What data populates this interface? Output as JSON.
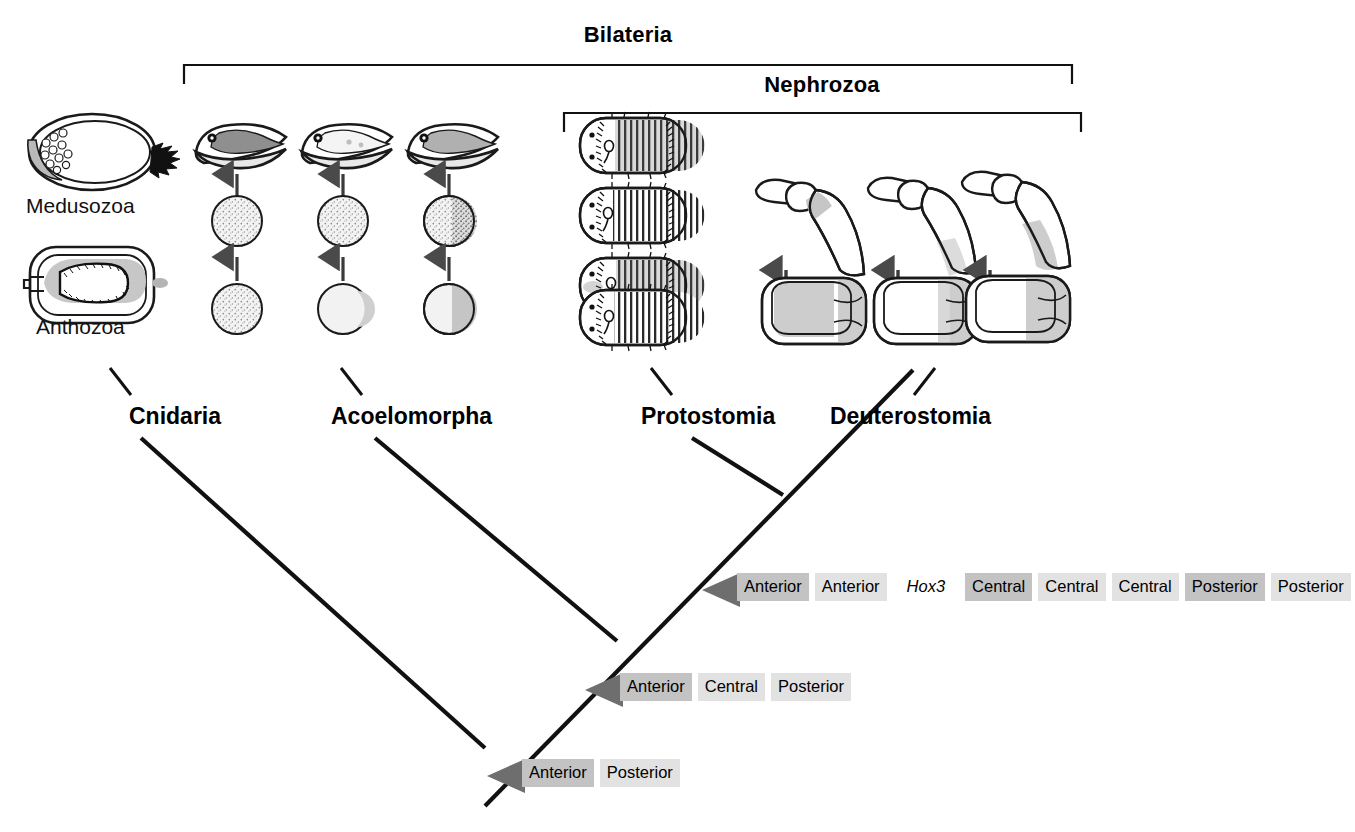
{
  "figure": {
    "type": "cladogram-with-illustrations",
    "background": "#ffffff"
  },
  "brackets": [
    {
      "name": "bilateria",
      "label": "Bilateria",
      "x1": 184,
      "x2": 1072,
      "y": 65,
      "label_x": 628,
      "label_y": 22
    },
    {
      "name": "nephrozoa",
      "label": "Nephrozoa",
      "x1": 564,
      "x2": 1081,
      "y": 113,
      "label_x": 822,
      "label_y": 72
    }
  ],
  "taxa": [
    {
      "name": "cnidaria",
      "label": "Cnidaria",
      "x": 129,
      "y": 403
    },
    {
      "name": "acoelomorpha",
      "label": "Acoelomorpha",
      "x": 331,
      "y": 403
    },
    {
      "name": "protostomia",
      "label": "Protostomia",
      "x": 641,
      "y": 403
    },
    {
      "name": "deuterostomia",
      "label": "Deuterostomia",
      "x": 830,
      "y": 403
    }
  ],
  "illustration_captions": [
    {
      "name": "medusozoa",
      "label": "Medusozoa",
      "x": 26,
      "y": 194
    },
    {
      "name": "anthozoa",
      "label": "Anthozoa",
      "x": 36,
      "y": 315
    }
  ],
  "hox_rows": [
    {
      "name": "nephrozoa-hox-cluster",
      "arrow_x": 700,
      "arrow_y": 575,
      "boxes_x": 737,
      "boxes_y": 573,
      "genes": [
        {
          "label": "Anterior",
          "shade": "dark"
        },
        {
          "label": "Anterior",
          "shade": "light"
        },
        {
          "label": "Hox3",
          "shade": "plain"
        },
        {
          "label": "Central",
          "shade": "dark"
        },
        {
          "label": "Central",
          "shade": "light"
        },
        {
          "label": "Central",
          "shade": "light"
        },
        {
          "label": "Posterior",
          "shade": "dark"
        },
        {
          "label": "Posterior",
          "shade": "light"
        }
      ]
    },
    {
      "name": "bilateria-hox-cluster",
      "arrow_x": 583,
      "arrow_y": 675,
      "boxes_x": 620,
      "boxes_y": 673,
      "genes": [
        {
          "label": "Anterior",
          "shade": "dark"
        },
        {
          "label": "Central",
          "shade": "light"
        },
        {
          "label": "Posterior",
          "shade": "light"
        }
      ]
    },
    {
      "name": "eumetazoa-hox-cluster",
      "arrow_x": 485,
      "arrow_y": 761,
      "boxes_x": 522,
      "boxes_y": 759,
      "genes": [
        {
          "label": "Anterior",
          "shade": "dark"
        },
        {
          "label": "Posterior",
          "shade": "light"
        }
      ]
    }
  ],
  "tree": {
    "root_node": {
      "x": 485,
      "y": 748
    },
    "nodes": [
      {
        "name": "node-eumetazoa",
        "x": 485,
        "y": 748
      },
      {
        "name": "node-bilateria",
        "x": 617,
        "y": 641
      },
      {
        "name": "node-nephrozoa",
        "x": 783,
        "y": 495
      }
    ],
    "branches": [
      {
        "name": "branch-cnidaria",
        "x1": 141,
        "y1": 438,
        "x2": 485,
        "y2": 748
      },
      {
        "name": "branch-acoelomorpha",
        "x1": 375,
        "y1": 438,
        "x2": 617,
        "y2": 641
      },
      {
        "name": "branch-protostomia",
        "x1": 692,
        "y1": 438,
        "x2": 783,
        "y2": 495
      },
      {
        "name": "branch-deuterostomia",
        "x1": 913,
        "y1": 370,
        "x2": 485,
        "y2": 806
      }
    ],
    "stubs": [
      {
        "name": "stub-cnidaria",
        "x1": 110,
        "y1": 368,
        "x2": 131,
        "y2": 395
      },
      {
        "name": "stub-acoelomorpha",
        "x1": 341,
        "y1": 368,
        "x2": 362,
        "y2": 395
      },
      {
        "name": "stub-protostomia",
        "x1": 651,
        "y1": 368,
        "x2": 672,
        "y2": 395
      },
      {
        "name": "stub-deuterostomia",
        "x1": 935,
        "y1": 368,
        "x2": 914,
        "y2": 395
      }
    ]
  },
  "stage_columns": {
    "acoelomorph": [
      {
        "name": "acoel-col-1",
        "cx": 237,
        "hox_shade": "none"
      },
      {
        "name": "acoel-col-2",
        "cx": 343,
        "hox_shade": "partial"
      },
      {
        "name": "acoel-col-3",
        "cx": 449,
        "hox_shade": "full"
      }
    ],
    "deuterostome": [
      {
        "name": "deut-col-1",
        "cx": 814
      },
      {
        "name": "deut-col-2",
        "cx": 934
      },
      {
        "name": "deut-col-3",
        "cx": 1022
      }
    ],
    "protostome_embryo_count": 4
  },
  "colors": {
    "line": "#111111",
    "bracket": "#8d8d8d",
    "arrow_marker": "#6e6e6e",
    "hox_dark": "#c3c3c3",
    "hox_light": "#e2e2e2",
    "tissue_gray": "#c9c9c9",
    "tissue_gray_dark": "#9c9c9c",
    "tissue_gray_light": "#ededed"
  }
}
